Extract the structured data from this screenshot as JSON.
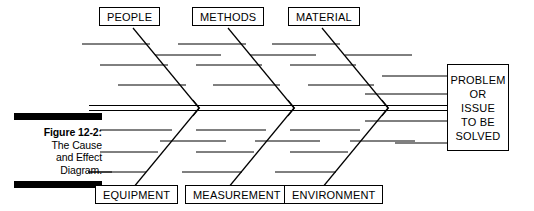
{
  "figure": {
    "caption_lines": [
      {
        "text": "Figure 12-2:",
        "bold": true
      },
      {
        "text": "The Cause",
        "bold": false
      },
      {
        "text": "and Effect",
        "bold": false
      },
      {
        "text": "Diagram.",
        "bold": false
      }
    ],
    "rule_color": "#000000"
  },
  "diagram": {
    "type": "fishbone-cause-and-effect",
    "line_color": "#000000",
    "background": "#ffffff",
    "effect": {
      "lines": [
        "PROBLEM",
        "OR",
        "ISSUE",
        "TO BE",
        "SOLVED"
      ]
    },
    "categories_top": [
      {
        "label": "PEOPLE",
        "causes_count": 4
      },
      {
        "label": "METHODS",
        "causes_count": 4
      },
      {
        "label": "MATERIAL",
        "causes_count": 4
      }
    ],
    "categories_bottom": [
      {
        "label": "EQUIPMENT",
        "causes_count": 4
      },
      {
        "label": "MEASUREMENT",
        "causes_count": 4
      },
      {
        "label": "ENVIRONMENT",
        "causes_count": 4
      }
    ]
  }
}
